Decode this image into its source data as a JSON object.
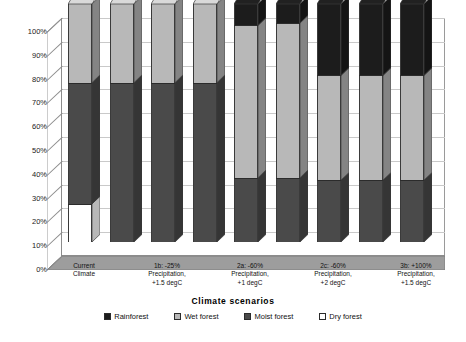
{
  "chart_data": {
    "type": "bar",
    "subtype": "stacked-column-100-percent-3d",
    "title": "",
    "xlabel": "Climate scenarios",
    "ylabel": "",
    "ylim": [
      0,
      100
    ],
    "ytick_labels": [
      "0%",
      "10%",
      "20%",
      "30%",
      "40%",
      "50%",
      "60%",
      "70%",
      "80%",
      "90%",
      "100%"
    ],
    "ytick_values": [
      0,
      10,
      20,
      30,
      40,
      50,
      60,
      70,
      80,
      90,
      100
    ],
    "grid": true,
    "legend_position": "bottom",
    "categories": [
      "Current Climate",
      "",
      "1b: -25% Precipitation, +1.5 degC",
      "",
      "2a: -60% Precipitation, +1 degC",
      "",
      "2c: -60% Precipitation, +2 degC",
      "",
      "3b: +100% Precipitation, +1.5 degC"
    ],
    "category_labels": [
      {
        "lines": [
          "Current",
          "Climate"
        ]
      },
      {
        "lines": [
          "1b: -25%",
          "Precipitation,",
          "+1.5 degC"
        ]
      },
      {
        "lines": [
          "2a: -60%",
          "Precipitation,",
          "+1 degC"
        ]
      },
      {
        "lines": [
          "2c: -60%",
          "Precipitation,",
          "+2 degC"
        ]
      },
      {
        "lines": [
          "3b: +100%",
          "Precipitation,",
          "+1.5 degC"
        ]
      }
    ],
    "series": [
      {
        "name": "Rainforest",
        "color": "#1c1c1c",
        "values": [
          0,
          0,
          0,
          0,
          9,
          8,
          30,
          30,
          30
        ]
      },
      {
        "name": "Wet forest",
        "color": "#b8b8b8",
        "values": [
          33,
          33,
          33,
          33,
          64,
          65,
          44,
          44,
          44
        ]
      },
      {
        "name": "Moist forest",
        "color": "#4a4a4a",
        "values": [
          51,
          67,
          67,
          67,
          27,
          27,
          26,
          26,
          26
        ]
      },
      {
        "name": "Dry forest",
        "color": "#ffffff",
        "values": [
          16,
          0,
          0,
          0,
          0,
          0,
          0,
          0,
          0
        ]
      }
    ],
    "bars": [
      {
        "segments": [
          {
            "series": "Dry forest",
            "start": 0,
            "end": 16
          },
          {
            "series": "Moist forest",
            "start": 16,
            "end": 67
          },
          {
            "series": "Wet forest",
            "start": 67,
            "end": 100
          }
        ]
      },
      {
        "segments": [
          {
            "series": "Moist forest",
            "start": 0,
            "end": 67
          },
          {
            "series": "Wet forest",
            "start": 67,
            "end": 100
          }
        ]
      },
      {
        "segments": [
          {
            "series": "Moist forest",
            "start": 0,
            "end": 67
          },
          {
            "series": "Wet forest",
            "start": 67,
            "end": 100
          }
        ]
      },
      {
        "segments": [
          {
            "series": "Moist forest",
            "start": 0,
            "end": 67
          },
          {
            "series": "Wet forest",
            "start": 67,
            "end": 100
          }
        ]
      },
      {
        "segments": [
          {
            "series": "Moist forest",
            "start": 0,
            "end": 27
          },
          {
            "series": "Wet forest",
            "start": 27,
            "end": 91
          },
          {
            "series": "Rainforest",
            "start": 91,
            "end": 100
          }
        ]
      },
      {
        "segments": [
          {
            "series": "Moist forest",
            "start": 0,
            "end": 27
          },
          {
            "series": "Wet forest",
            "start": 27,
            "end": 92
          },
          {
            "series": "Rainforest",
            "start": 92,
            "end": 100
          }
        ]
      },
      {
        "segments": [
          {
            "series": "Moist forest",
            "start": 0,
            "end": 26
          },
          {
            "series": "Wet forest",
            "start": 26,
            "end": 70
          },
          {
            "series": "Rainforest",
            "start": 70,
            "end": 100
          }
        ]
      },
      {
        "segments": [
          {
            "series": "Moist forest",
            "start": 0,
            "end": 26
          },
          {
            "series": "Wet forest",
            "start": 26,
            "end": 70
          },
          {
            "series": "Rainforest",
            "start": 70,
            "end": 100
          }
        ]
      },
      {
        "segments": [
          {
            "series": "Moist forest",
            "start": 0,
            "end": 26
          },
          {
            "series": "Wet forest",
            "start": 26,
            "end": 70
          },
          {
            "series": "Rainforest",
            "start": 70,
            "end": 100
          }
        ]
      }
    ]
  },
  "legend": {
    "items": [
      {
        "label": "Rainforest",
        "swatch": "rainforest"
      },
      {
        "label": "Wet forest",
        "swatch": "wetforest"
      },
      {
        "label": "Moist forest",
        "swatch": "moistforest"
      },
      {
        "label": "Dry forest",
        "swatch": "dryforest"
      }
    ]
  },
  "axis": {
    "x_title": "Climate scenarios"
  }
}
